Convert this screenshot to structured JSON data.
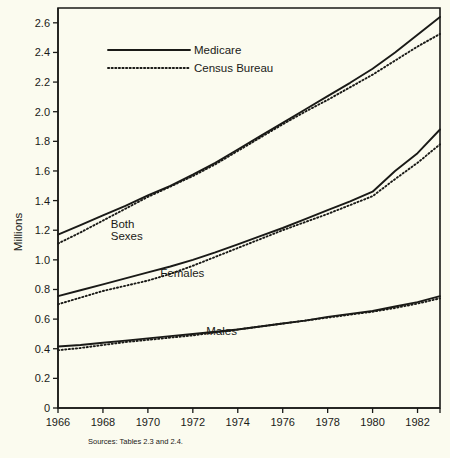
{
  "chart_data": {
    "type": "line",
    "title": "",
    "xlabel": "",
    "ylabel": "Millions",
    "xlim": [
      1966,
      1983
    ],
    "ylim": [
      0,
      2.7
    ],
    "grid": false,
    "legend_position": "top-left-inside",
    "x_ticks": [
      "1966",
      "1968",
      "1970",
      "1972",
      "1974",
      "1976",
      "1978",
      "1980",
      "1982"
    ],
    "x_tick_values": [
      1966,
      1968,
      1970,
      1972,
      1974,
      1976,
      1978,
      1980,
      1982
    ],
    "y_ticks": [
      "0",
      "0.2",
      "0.4",
      "0.6",
      "0.8",
      "1.0",
      "1.2",
      "1.4",
      "1.6",
      "1.8",
      "2.0",
      "2.2",
      "2.4",
      "2.6"
    ],
    "y_tick_values": [
      0,
      0.2,
      0.4,
      0.6,
      0.8,
      1.0,
      1.2,
      1.4,
      1.6,
      1.8,
      2.0,
      2.2,
      2.4,
      2.6
    ],
    "legend": [
      {
        "name": "Medicare",
        "style": "solid"
      },
      {
        "name": "Census Bureau",
        "style": "dotted"
      }
    ],
    "annotations": [
      {
        "text": "Both",
        "x": 1968.35,
        "y": 1.215
      },
      {
        "text": "Sexes",
        "x": 1968.35,
        "y": 1.135
      },
      {
        "text": "Females",
        "x": 1970.55,
        "y": 0.885
      },
      {
        "text": "Males",
        "x": 1972.6,
        "y": 0.495
      }
    ],
    "x": [
      1966,
      1967,
      1968,
      1969,
      1970,
      1971,
      1972,
      1973,
      1974,
      1975,
      1976,
      1977,
      1978,
      1979,
      1980,
      1981,
      1982,
      1983
    ],
    "series": [
      {
        "name": "Both Sexes - Medicare",
        "group": "Both Sexes",
        "source": "Medicare",
        "style": "solid",
        "values": [
          1.17,
          1.235,
          1.3,
          1.365,
          1.435,
          1.5,
          1.575,
          1.655,
          1.745,
          1.835,
          1.925,
          2.015,
          2.105,
          2.195,
          2.29,
          2.4,
          2.52,
          2.64
        ]
      },
      {
        "name": "Both Sexes - Census Bureau",
        "group": "Both Sexes",
        "source": "Census Bureau",
        "style": "dotted",
        "values": [
          1.11,
          1.185,
          1.265,
          1.345,
          1.425,
          1.495,
          1.565,
          1.645,
          1.735,
          1.825,
          1.915,
          2.0,
          2.08,
          2.165,
          2.25,
          2.345,
          2.44,
          2.525
        ]
      },
      {
        "name": "Females - Medicare",
        "group": "Females",
        "source": "Medicare",
        "style": "solid",
        "values": [
          0.755,
          0.795,
          0.835,
          0.875,
          0.915,
          0.955,
          1.0,
          1.05,
          1.105,
          1.16,
          1.215,
          1.275,
          1.335,
          1.395,
          1.46,
          1.6,
          1.72,
          1.88
        ]
      },
      {
        "name": "Females - Census Bureau",
        "group": "Females",
        "source": "Census Bureau",
        "style": "dotted",
        "values": [
          0.7,
          0.745,
          0.79,
          0.825,
          0.86,
          0.905,
          0.96,
          1.02,
          1.08,
          1.14,
          1.2,
          1.255,
          1.31,
          1.37,
          1.43,
          1.545,
          1.655,
          1.78
        ]
      },
      {
        "name": "Males - Medicare",
        "group": "Males",
        "source": "Medicare",
        "style": "solid",
        "values": [
          0.415,
          0.425,
          0.44,
          0.455,
          0.47,
          0.485,
          0.5,
          0.515,
          0.53,
          0.55,
          0.57,
          0.59,
          0.615,
          0.635,
          0.655,
          0.685,
          0.715,
          0.755
        ]
      },
      {
        "name": "Males - Census Bureau",
        "group": "Males",
        "source": "Census Bureau",
        "style": "dotted",
        "values": [
          0.39,
          0.405,
          0.425,
          0.445,
          0.46,
          0.475,
          0.49,
          0.51,
          0.53,
          0.55,
          0.57,
          0.59,
          0.61,
          0.63,
          0.65,
          0.675,
          0.705,
          0.74
        ]
      }
    ]
  },
  "source_note": "Sources: Tables 2.3 and 2.4."
}
